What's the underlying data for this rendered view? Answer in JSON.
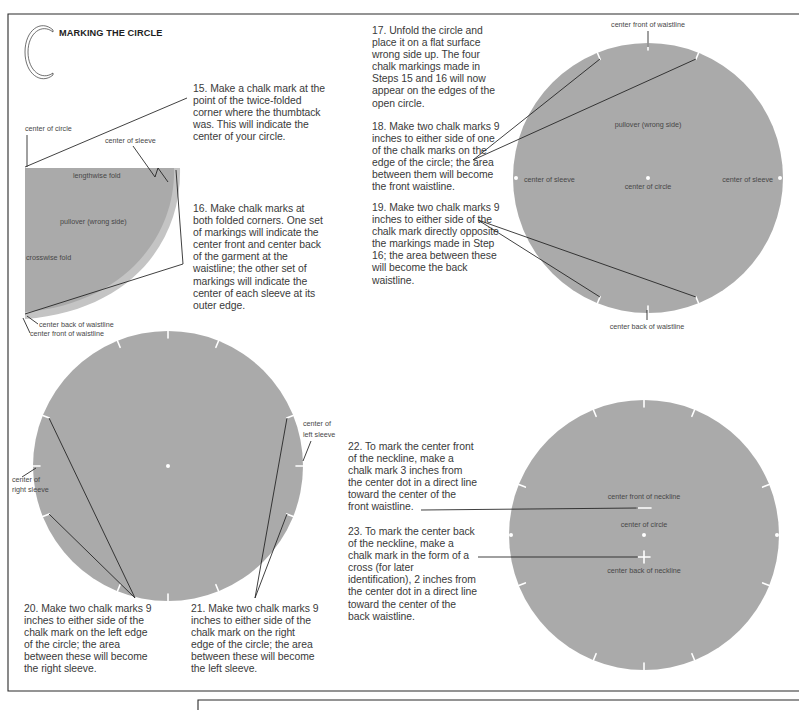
{
  "header": {
    "drop_cap": "C",
    "title": "MARKING THE CIRCLE"
  },
  "colors": {
    "fabric": "#aaaaaa",
    "fabric_edge": "#c4c4c4",
    "chalk": "#ffffff",
    "text": "#3a3a3a"
  },
  "steps": {
    "s15": "15. Make a chalk mark at the\npoint of the twice-folded\ncorner where the thumbtack\nwas. This will indicate the\ncenter of your circle.",
    "s16": "16. Make chalk marks at\nboth folded corners. One set\nof markings will indicate the\ncenter front and center back\nof the garment at the\nwaistline; the other set of\nmarkings will indicate the\ncenter of each sleeve at its\nouter edge.",
    "s17": "17. Unfold the circle and\nplace it on a flat surface\nwrong side up. The four\nchalk markings made in\nSteps 15 and 16 will now\nappear on the edges of the\nopen circle.",
    "s18": "18. Make two chalk marks 9\ninches to either side of one\nof the chalk marks on the\nedge of the circle; the area\nbetween them will become\nthe front waistline.",
    "s19": "19. Make two chalk marks 9\ninches to either side of the\nchalk mark directly opposite\nthe markings made in Step\n16; the area between these\nwill become the back\nwaistline.",
    "s20": "20. Make two chalk marks 9\ninches to either side of the\nchalk mark on the left edge\nof the circle; the area\nbetween these will become\nthe right sleeve.",
    "s21": "21. Make two chalk marks 9\ninches to either side of the\nchalk mark on the right\nedge of the circle; the area\nbetween these will become\nthe left sleeve.",
    "s22": "22. To mark the center front\nof the neckline, make a\nchalk mark 3 inches from\nthe center dot in a direct line\ntoward the center of the\nfront waistline.",
    "s23": "23. To mark the center back\nof the neckline, make a\nchalk mark in the form of a\ncross (for later\nidentification), 2 inches from\nthe center dot in a direct line\ntoward the center of the\nback waistline."
  },
  "diagrams": {
    "folded": {
      "center_of_circle": "center of circle",
      "center_of_sleeve": "center of sleeve",
      "lengthwise_fold": "lengthwise fold",
      "pullover": "pullover (wrong side)",
      "crosswise_fold": "crosswise fold",
      "center_back_waistline": "center back of waistline",
      "center_front_waistline": "center front of waistline"
    },
    "open_circle": {
      "center_front_waistline": "center front of waistline",
      "pullover": "pullover (wrong side)",
      "center_of_sleeve_left": "center of sleeve",
      "center_of_circle": "center of circle",
      "center_of_sleeve_right": "center of sleeve",
      "center_back_waistline": "center back of waistline"
    },
    "sleeve_circle": {
      "right_sleeve_line1": "center of",
      "right_sleeve_line2": "right sleeve",
      "left_sleeve_line1": "center of",
      "left_sleeve_line2": "left sleeve"
    },
    "neckline_circle": {
      "center_front_neckline": "center front of neckline",
      "center_of_circle": "center of circle",
      "center_back_neckline": "center back of neckline"
    }
  }
}
